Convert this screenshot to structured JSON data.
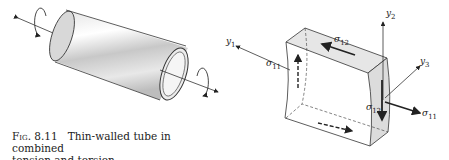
{
  "figure": {
    "number": "Fig. 8.11",
    "caption_line1": "Thin-walled tube in combined",
    "caption_line2": "tension and torsion.",
    "labels": {
      "y1": {
        "base": "y",
        "sub": "1"
      },
      "y2": {
        "base": "y",
        "sub": "2"
      },
      "y3": {
        "base": "y",
        "sub": "3"
      },
      "sigma11_left": {
        "base": "σ",
        "sub": "11"
      },
      "sigma11_right": {
        "base": "σ",
        "sub": "11"
      },
      "sigma12_top": {
        "base": "σ",
        "sub": "12"
      },
      "sigma12_right": {
        "base": "σ",
        "sub": "12"
      }
    }
  }
}
